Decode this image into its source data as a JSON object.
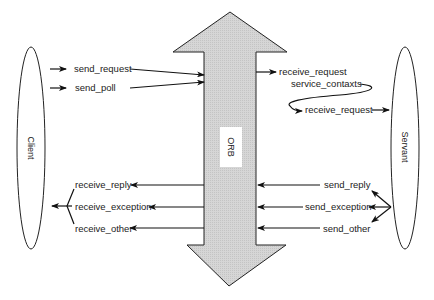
{
  "diagram": {
    "orb": {
      "label": "ORB",
      "fill": "#d4d4d4"
    },
    "client": {
      "label": "Client"
    },
    "servant": {
      "label": "Servant"
    },
    "client_outgoing": [
      "send_request",
      "send_poll"
    ],
    "orb_to_servant": {
      "receive_request_1": "receive_request",
      "service_contexts": "service_contaxts",
      "receive_request_2": "receive_request"
    },
    "servant_outgoing": [
      "send_reply",
      "send_exception",
      "send_other"
    ],
    "client_incoming": [
      "receive_reply",
      "receive_exception",
      "receive_other"
    ]
  }
}
